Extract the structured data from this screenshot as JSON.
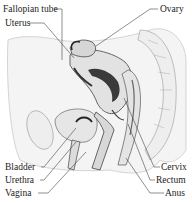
{
  "diagram": {
    "labels_left": [
      {
        "text": "Fallopian tube",
        "x": 3,
        "y": 6
      },
      {
        "text": "Uterus",
        "x": 5,
        "y": 20
      },
      {
        "text": "Bladder",
        "x": 5,
        "y": 164
      },
      {
        "text": "Urethra",
        "x": 5,
        "y": 177
      },
      {
        "text": "Vagina",
        "x": 5,
        "y": 190
      }
    ],
    "labels_right": [
      {
        "text": "Ovary",
        "x": 160,
        "y": 6
      },
      {
        "text": "Cervix",
        "x": 161,
        "y": 164
      },
      {
        "text": "Rectum",
        "x": 156,
        "y": 177
      },
      {
        "text": "Anus",
        "x": 165,
        "y": 190
      }
    ],
    "colors": {
      "ink": "#222222",
      "organ_fill": "#e8e8e8",
      "dark_fill": "#3a3a3a",
      "line": "#444444"
    }
  }
}
